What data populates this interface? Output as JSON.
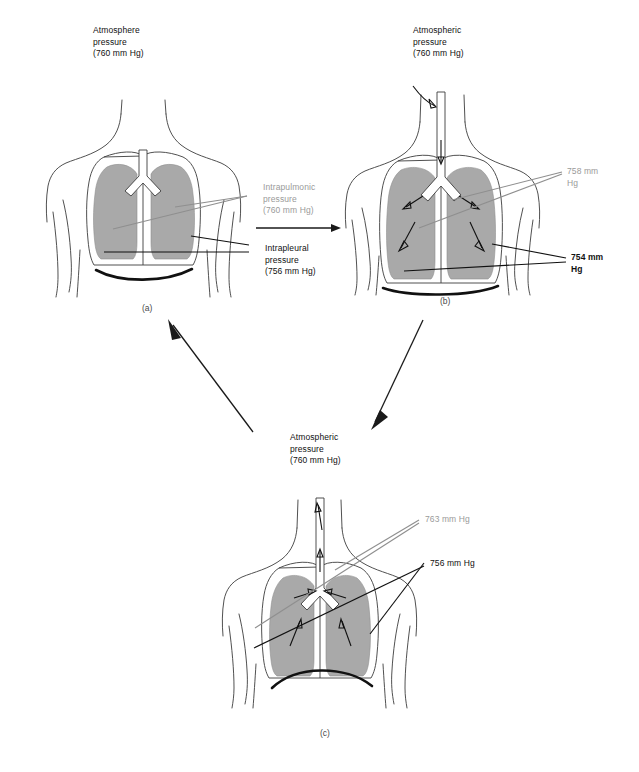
{
  "figure": {
    "lung_fill_color": "#a9a9a9",
    "gray_label_color": "#9a9a9a",
    "black_label_color": "#111111"
  },
  "panels": [
    {
      "id": "a",
      "letter": "(a)",
      "heading": "Atmosphere\npressure\n(760 mm Hg)",
      "phase": "at rest / end of expiration",
      "labels": [
        {
          "text": "Intrapulmonic\npressure\n(760 mm  Hg)",
          "color": "gray"
        },
        {
          "text": "Intrapleural\npressure\n(756 mm Hg)",
          "color": "black"
        }
      ]
    },
    {
      "id": "b",
      "letter": "(b)",
      "heading": "Atmospheric\npressure\n(760 mm Hg)",
      "phase": "inspiration",
      "labels": [
        {
          "text": "758 mm\nHg",
          "color": "gray"
        },
        {
          "text": "754 mm\nHg",
          "color": "black"
        }
      ]
    },
    {
      "id": "c",
      "letter": "(c)",
      "heading": "Atmospheric\npressure\n(760 mm Hg)",
      "phase": "expiration",
      "labels": [
        {
          "text": "763 mm  Hg",
          "color": "gray"
        },
        {
          "text": "756 mm Hg",
          "color": "black"
        }
      ]
    }
  ],
  "cycle_arrows": [
    {
      "from": "a",
      "to": "b",
      "direction": "right"
    },
    {
      "from": "b",
      "to": "c",
      "direction": "down-left"
    },
    {
      "from": "c",
      "to": "a",
      "direction": "up-left"
    }
  ]
}
